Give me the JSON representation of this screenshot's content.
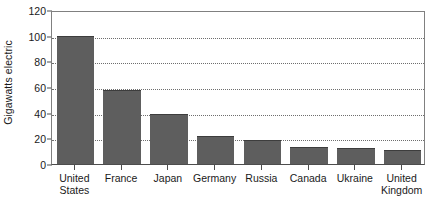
{
  "chart_data": {
    "type": "bar",
    "title": "",
    "subtitle": "",
    "xlabel": "",
    "ylabel": "Gigawatts electric",
    "categories": [
      "United States",
      "France",
      "Japan",
      "Germany",
      "Russia",
      "Canada",
      "Ukraine",
      "United Kingdom"
    ],
    "category_lines": [
      [
        "United",
        "States"
      ],
      [
        "France"
      ],
      [
        "Japan"
      ],
      [
        "Germany"
      ],
      [
        "Russia"
      ],
      [
        "Canada"
      ],
      [
        "Ukraine"
      ],
      [
        "United",
        "Kingdom"
      ]
    ],
    "values": [
      100,
      57.5,
      39,
      21.5,
      19,
      13.5,
      12.5,
      11
    ],
    "ylim": [
      0,
      120
    ],
    "yticks": [
      0,
      20,
      40,
      60,
      80,
      100,
      120
    ],
    "ytick_labels": [
      "0",
      "20",
      "40",
      "60",
      "80",
      "100",
      "120"
    ],
    "gridlines": [
      20,
      40,
      60,
      80,
      100
    ],
    "grid": true,
    "grid_axis": "y",
    "grid_style": "dotted",
    "legend": false,
    "legend_position": "none",
    "bar_color": "#5e5e5e",
    "bar_edge_color": "#3d3d3d",
    "axis_color": "#4d4d4d",
    "frame_color": "#808080",
    "text_color": "#1a1a1a",
    "background": "#ffffff"
  }
}
